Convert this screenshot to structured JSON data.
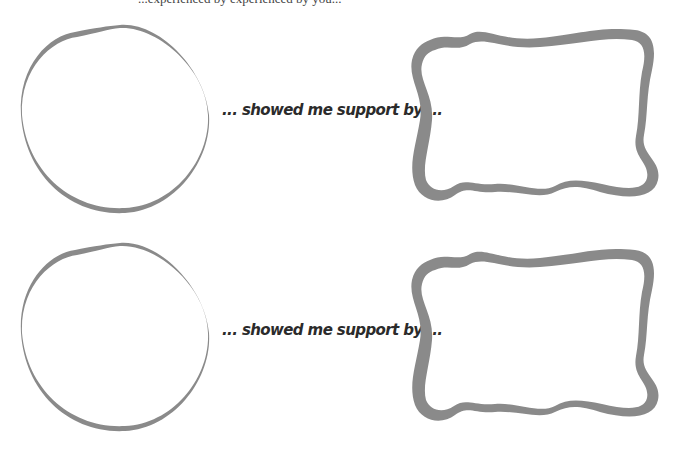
{
  "header": {
    "partial_text": "...experienced by experienced by you..."
  },
  "rows": [
    {
      "caption": "... showed me support by ..."
    },
    {
      "caption": "... showed me support by ..."
    }
  ],
  "colors": {
    "outline": "#8a8a8a",
    "text": "#2b2b2b",
    "background": "#ffffff"
  }
}
